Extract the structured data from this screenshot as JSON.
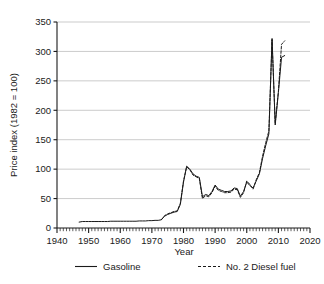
{
  "chart_data": {
    "type": "line",
    "title": "",
    "xlabel": "Year",
    "ylabel": "Price index (1982 = 100)",
    "xlim": [
      1940,
      2020
    ],
    "ylim": [
      0,
      350
    ],
    "xticks": [
      1940,
      1950,
      1960,
      1970,
      1980,
      1990,
      2000,
      2010,
      2020
    ],
    "yticks": [
      0,
      50,
      100,
      150,
      200,
      250,
      300,
      350
    ],
    "xtick_labels": [
      "1940",
      "1950",
      "1960",
      "1970",
      "1980",
      "1990",
      "2000",
      "2010",
      "2020"
    ],
    "ytick_labels": [
      "0",
      "50",
      "100",
      "150",
      "200",
      "250",
      "300",
      "350"
    ],
    "minor_xtick_step": 1,
    "grid": "horizontal",
    "grid_color": "#b5b5b5",
    "legend_position": "below",
    "series": [
      {
        "name": "Gasoline",
        "style": "solid",
        "color": "#1a1a1a",
        "x": [
          1947,
          1948,
          1949,
          1950,
          1951,
          1952,
          1953,
          1954,
          1955,
          1956,
          1957,
          1958,
          1959,
          1960,
          1961,
          1962,
          1963,
          1964,
          1965,
          1966,
          1967,
          1968,
          1969,
          1970,
          1971,
          1972,
          1973,
          1974,
          1975,
          1976,
          1977,
          1978,
          1979,
          1980,
          1981,
          1982,
          1983,
          1984,
          1985,
          1986,
          1987,
          1988,
          1989,
          1990,
          1991,
          1992,
          1993,
          1994,
          1995,
          1996,
          1997,
          1998,
          1999,
          2000,
          2001,
          2002,
          2003,
          2004,
          2005,
          2006,
          2007,
          2008,
          2009,
          2010,
          2011,
          2012
        ],
        "values": [
          10,
          11,
          11,
          11,
          11,
          11,
          11,
          11,
          11,
          11,
          11.5,
          11.5,
          11.5,
          11.5,
          11.5,
          11.5,
          11.5,
          11.5,
          11.5,
          12,
          12,
          12,
          12.5,
          12.5,
          13,
          13,
          14,
          20,
          23,
          25,
          27,
          28,
          40,
          78,
          105,
          100,
          92,
          88,
          86,
          53,
          57,
          55,
          62,
          73,
          66,
          64,
          62,
          62,
          63,
          68,
          67,
          54,
          62,
          78,
          72,
          68,
          80,
          92,
          118,
          140,
          160,
          322,
          175,
          230,
          290,
          293
        ]
      },
      {
        "name": "No. 2 Diesel fuel",
        "style": "dashed",
        "color": "#1a1a1a",
        "x": [
          1973,
          1974,
          1975,
          1976,
          1977,
          1978,
          1979,
          1980,
          1981,
          1982,
          1983,
          1984,
          1985,
          1986,
          1987,
          1988,
          1989,
          1990,
          1991,
          1992,
          1993,
          1994,
          1995,
          1996,
          1997,
          1998,
          1999,
          2000,
          2001,
          2002,
          2003,
          2004,
          2005,
          2006,
          2007,
          2008,
          2009,
          2010,
          2011,
          2012
        ],
        "values": [
          14,
          21,
          24,
          26,
          28,
          29,
          42,
          80,
          104,
          99,
          90,
          87,
          84,
          50,
          55,
          53,
          60,
          71,
          64,
          62,
          60,
          60,
          61,
          66,
          65,
          52,
          60,
          80,
          74,
          66,
          82,
          94,
          122,
          145,
          165,
          320,
          178,
          232,
          312,
          318
        ]
      }
    ]
  },
  "legend": {
    "items": [
      {
        "label": "Gasoline",
        "style": "solid"
      },
      {
        "label": "No. 2 Diesel fuel",
        "style": "dashed"
      }
    ]
  }
}
